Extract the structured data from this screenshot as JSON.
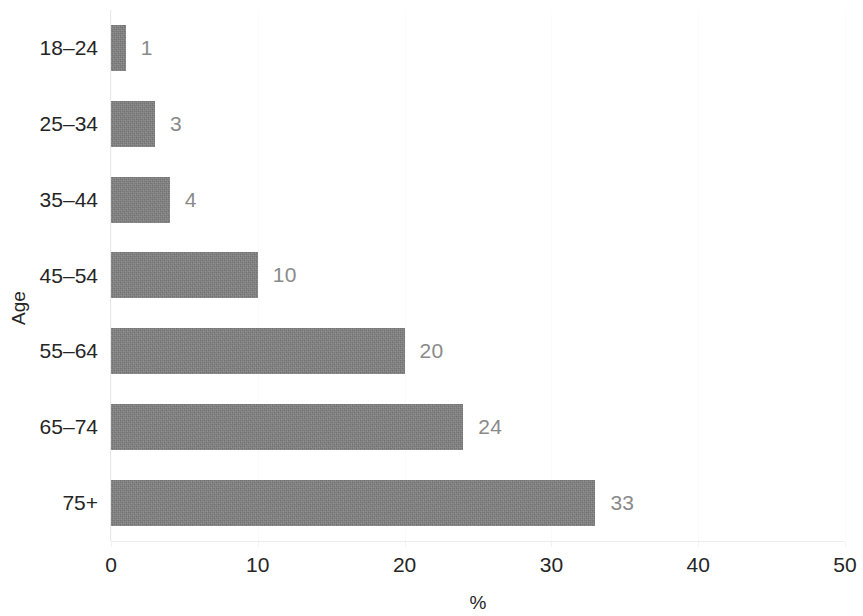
{
  "chart_data": {
    "type": "bar",
    "orientation": "horizontal",
    "title": "",
    "subtitle": "",
    "xlabel": "%",
    "ylabel": "Age",
    "categories": [
      "18–24",
      "25–34",
      "35–44",
      "45–54",
      "55–64",
      "65–74",
      "75+"
    ],
    "values": [
      1,
      3,
      4,
      10,
      20,
      24,
      33
    ],
    "data_labels": [
      "1",
      "3",
      "4",
      "10",
      "20",
      "24",
      "33"
    ],
    "xlim": [
      0,
      50
    ],
    "xticks": [
      0,
      10,
      20,
      30,
      40,
      50
    ],
    "xtick_labels": [
      "0",
      "10",
      "20",
      "30",
      "40",
      "50"
    ],
    "grid": true,
    "grid_axis": "x",
    "legend": null,
    "series": [
      {
        "name": "%",
        "values": [
          1,
          3,
          4,
          10,
          20,
          24,
          33
        ]
      }
    ]
  },
  "style": {
    "bar_color": "#828282",
    "data_label_color": "#8a8a8a",
    "axis_text_color": "#252525",
    "background": "#ffffff",
    "gridline_color": "#fbfbfb"
  }
}
